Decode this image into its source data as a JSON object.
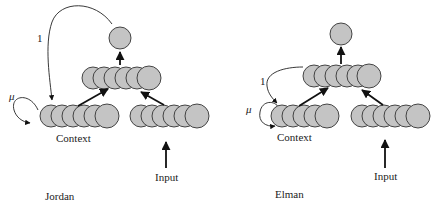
{
  "diagrams": [
    {
      "title": "Jordan",
      "context_label": "Context",
      "input_label": "Input",
      "feedback_weight_label": "1",
      "self_loop_label": "μ"
    },
    {
      "title": "Elman",
      "context_label": "Context",
      "input_label": "Input",
      "feedback_weight_label": "1",
      "self_loop_label": "μ"
    }
  ],
  "colors": {
    "node_fill": "#c4c4c4",
    "node_stroke": "#333333",
    "line": "#111111"
  }
}
